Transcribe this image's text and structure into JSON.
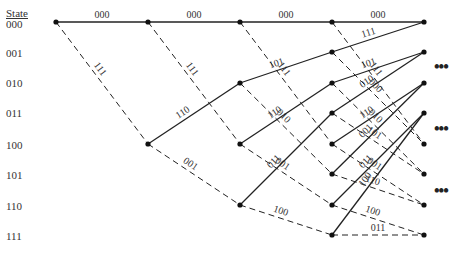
{
  "header": {
    "state_label": "State"
  },
  "states": [
    "000",
    "001",
    "010",
    "011",
    "100",
    "101",
    "110",
    "111"
  ],
  "stage_x": [
    56,
    148,
    240,
    332,
    424
  ],
  "state_y": [
    22,
    52,
    83,
    113,
    144,
    174,
    205,
    235
  ],
  "legend": {
    "solid": "input bit 0",
    "dashed": "input bit 1"
  },
  "ellipsis": [
    "•••",
    "•••",
    "•••"
  ],
  "branches": [
    {
      "from": [
        0,
        0
      ],
      "to": [
        1,
        0
      ],
      "style": "solid",
      "label": "000"
    },
    {
      "from": [
        0,
        0
      ],
      "to": [
        1,
        4
      ],
      "style": "dashed",
      "label": "111"
    },
    {
      "from": [
        1,
        0
      ],
      "to": [
        2,
        0
      ],
      "style": "solid",
      "label": "000"
    },
    {
      "from": [
        1,
        0
      ],
      "to": [
        2,
        4
      ],
      "style": "dashed",
      "label": "111"
    },
    {
      "from": [
        1,
        4
      ],
      "to": [
        2,
        2
      ],
      "style": "solid",
      "label": "110"
    },
    {
      "from": [
        1,
        4
      ],
      "to": [
        2,
        6
      ],
      "style": "dashed",
      "label": "001"
    },
    {
      "from": [
        2,
        0
      ],
      "to": [
        3,
        0
      ],
      "style": "solid",
      "label": "000"
    },
    {
      "from": [
        2,
        0
      ],
      "to": [
        3,
        4
      ],
      "style": "dashed",
      "label": "111"
    },
    {
      "from": [
        2,
        2
      ],
      "to": [
        3,
        1
      ],
      "style": "solid",
      "label": "101"
    },
    {
      "from": [
        2,
        2
      ],
      "to": [
        3,
        5
      ],
      "style": "dashed",
      "label": "010"
    },
    {
      "from": [
        2,
        4
      ],
      "to": [
        3,
        2
      ],
      "style": "solid",
      "label": "110"
    },
    {
      "from": [
        2,
        4
      ],
      "to": [
        3,
        6
      ],
      "style": "dashed",
      "label": "001"
    },
    {
      "from": [
        2,
        6
      ],
      "to": [
        3,
        3
      ],
      "style": "solid",
      "label": "011"
    },
    {
      "from": [
        2,
        6
      ],
      "to": [
        3,
        7
      ],
      "style": "dashed",
      "label": "100"
    },
    {
      "from": [
        3,
        0
      ],
      "to": [
        4,
        0
      ],
      "style": "solid",
      "label": "000"
    },
    {
      "from": [
        3,
        0
      ],
      "to": [
        4,
        4
      ],
      "style": "dashed",
      "label": "111"
    },
    {
      "from": [
        3,
        1
      ],
      "to": [
        4,
        0
      ],
      "style": "solid",
      "label": "111"
    },
    {
      "from": [
        3,
        1
      ],
      "to": [
        4,
        4
      ],
      "style": "dashed",
      "label": "000"
    },
    {
      "from": [
        3,
        2
      ],
      "to": [
        4,
        1
      ],
      "style": "solid",
      "label": "101"
    },
    {
      "from": [
        3,
        2
      ],
      "to": [
        4,
        5
      ],
      "style": "dashed",
      "label": "010"
    },
    {
      "from": [
        3,
        3
      ],
      "to": [
        4,
        1
      ],
      "style": "solid",
      "label": "010"
    },
    {
      "from": [
        3,
        3
      ],
      "to": [
        4,
        5
      ],
      "style": "dashed",
      "label": "101"
    },
    {
      "from": [
        3,
        4
      ],
      "to": [
        4,
        2
      ],
      "style": "solid",
      "label": "110"
    },
    {
      "from": [
        3,
        4
      ],
      "to": [
        4,
        6
      ],
      "style": "dashed",
      "label": "001"
    },
    {
      "from": [
        3,
        5
      ],
      "to": [
        4,
        2
      ],
      "style": "solid",
      "label": "001"
    },
    {
      "from": [
        3,
        5
      ],
      "to": [
        4,
        6
      ],
      "style": "dashed",
      "label": "110"
    },
    {
      "from": [
        3,
        6
      ],
      "to": [
        4,
        3
      ],
      "style": "solid",
      "label": "011"
    },
    {
      "from": [
        3,
        6
      ],
      "to": [
        4,
        7
      ],
      "style": "dashed",
      "label": "100"
    },
    {
      "from": [
        3,
        7
      ],
      "to": [
        4,
        3
      ],
      "style": "solid",
      "label": "100"
    },
    {
      "from": [
        3,
        7
      ],
      "to": [
        4,
        7
      ],
      "style": "dashed",
      "label": "011"
    }
  ]
}
